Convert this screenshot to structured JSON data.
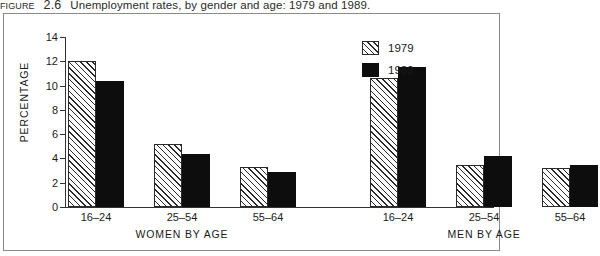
{
  "caption": {
    "figure_label": "FIGURE",
    "figure_number": "2.6",
    "text": "Unemployment rates, by gender and age: 1979 and 1989."
  },
  "legend": {
    "position": "top-right",
    "entries": [
      {
        "label": "1979",
        "pattern": "diagonal-hatch",
        "color": "#ffffff"
      },
      {
        "label": "1989",
        "pattern": "solid",
        "color": "#0d0d0d"
      }
    ]
  },
  "axes": {
    "y_title": "PERCENTAGE",
    "y_ticks": [
      "0",
      "2",
      "4",
      "6",
      "8",
      "10",
      "12",
      "14"
    ],
    "group_labels": [
      "WOMEN BY AGE",
      "MEN BY AGE"
    ]
  },
  "chart_data": {
    "type": "bar",
    "title": "Unemployment rates, by gender and age: 1979 and 1989.",
    "xlabel": "",
    "ylabel": "PERCENTAGE",
    "ylim": [
      0,
      14
    ],
    "ytick_step": 2,
    "grid": false,
    "legend_position": "top-right",
    "groups": [
      "WOMEN BY AGE",
      "MEN BY AGE"
    ],
    "categories": [
      "16-24",
      "25-54",
      "55-64",
      "16-24",
      "25-54",
      "55-64"
    ],
    "series": [
      {
        "name": "1979",
        "values": [
          12.0,
          5.2,
          3.3,
          10.6,
          3.5,
          3.2
        ]
      },
      {
        "name": "1989",
        "values": [
          10.4,
          4.4,
          2.9,
          11.5,
          4.2,
          3.5
        ]
      }
    ]
  },
  "bars": [
    {
      "group": "WOMEN BY AGE",
      "category": "16-24",
      "series": "1979",
      "value": 12.0
    },
    {
      "group": "WOMEN BY AGE",
      "category": "16-24",
      "series": "1989",
      "value": 10.4
    },
    {
      "group": "WOMEN BY AGE",
      "category": "25-54",
      "series": "1979",
      "value": 5.2
    },
    {
      "group": "WOMEN BY AGE",
      "category": "25-54",
      "series": "1989",
      "value": 4.4
    },
    {
      "group": "WOMEN BY AGE",
      "category": "55-64",
      "series": "1979",
      "value": 3.3
    },
    {
      "group": "WOMEN BY AGE",
      "category": "55-64",
      "series": "1989",
      "value": 2.9
    },
    {
      "group": "MEN BY AGE",
      "category": "16-24",
      "series": "1979",
      "value": 10.6
    },
    {
      "group": "MEN BY AGE",
      "category": "16-24",
      "series": "1989",
      "value": 11.5
    },
    {
      "group": "MEN BY AGE",
      "category": "25-54",
      "series": "1979",
      "value": 3.5
    },
    {
      "group": "MEN BY AGE",
      "category": "25-54",
      "series": "1989",
      "value": 4.2
    },
    {
      "group": "MEN BY AGE",
      "category": "55-64",
      "series": "1979",
      "value": 3.2
    },
    {
      "group": "MEN BY AGE",
      "category": "55-64",
      "series": "1989",
      "value": 3.5
    }
  ]
}
